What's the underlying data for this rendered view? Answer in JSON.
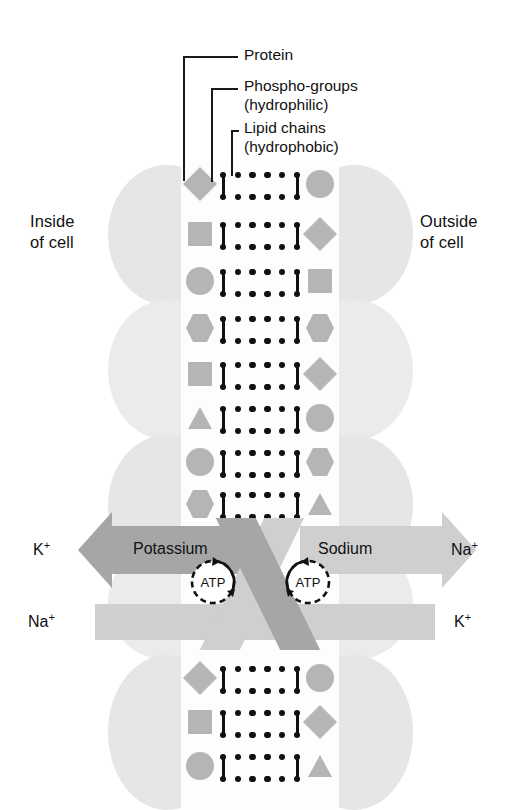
{
  "diagram": {
    "callouts": [
      {
        "id": "protein",
        "text": "Protein"
      },
      {
        "id": "phospho",
        "text": "Phospho-groups\n(hydrophilic)"
      },
      {
        "id": "lipid",
        "text": "Lipid chains\n(hydrophobic)"
      }
    ],
    "side_labels": {
      "inside": "Inside\nof cell",
      "outside": "Outside\nof cell"
    },
    "ion_labels": [
      {
        "id": "k-out-left",
        "ion": "K",
        "charge": "+"
      },
      {
        "id": "na-out-right",
        "ion": "Na",
        "charge": "+"
      },
      {
        "id": "na-in-left",
        "ion": "Na",
        "charge": "+"
      },
      {
        "id": "k-in-right",
        "ion": "K",
        "charge": "+"
      }
    ],
    "pump": {
      "left_label": "Potassium",
      "right_label": "Sodium",
      "energy_label_left": "ATP",
      "energy_label_right": "ATP"
    },
    "colors": {
      "protein_shape": "#b5b5b5",
      "background_blob": "#e6e6e6",
      "arrow_dark": "#a6a6a6",
      "arrow_light": "#cfcfcf",
      "ink": "#111111",
      "page": "#ffffff"
    },
    "membrane": {
      "left_column_shapes": [
        "diamond",
        "square",
        "circle",
        "hexagon",
        "square",
        "triangle",
        "circle",
        "hexagon",
        "diamond",
        "square",
        "circle"
      ],
      "right_column_shapes": [
        "circle",
        "diamond",
        "square",
        "hexagon",
        "diamond",
        "circle",
        "hexagon",
        "triangle",
        "circle",
        "diamond",
        "triangle"
      ],
      "lipid_dots_per_row": 4,
      "lipid_layers": 2
    }
  }
}
